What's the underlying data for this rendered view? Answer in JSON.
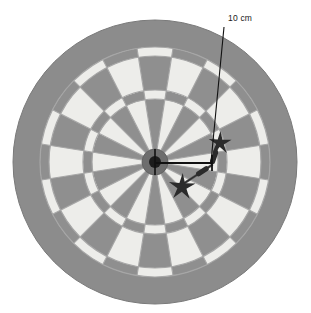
{
  "figure": {
    "background_color": "#ffffff"
  },
  "annotation": {
    "label": "10 cm",
    "label_x": 228,
    "label_y": 21,
    "leader_from": {
      "x": 224,
      "y": 27
    },
    "leader_to": {
      "x": 211,
      "y": 162
    },
    "measure_line": {
      "x1": 155,
      "y1": 163,
      "x2": 212,
      "y2": 163
    },
    "measure_tick": {
      "x": 212,
      "y1": 155,
      "y2": 171
    },
    "line_color": "#111111",
    "text_color": "#1a1a1a"
  },
  "board": {
    "center": {
      "x": 155,
      "y": 162
    },
    "outer_radius": 142,
    "surround_inner_radius": 117,
    "double_outer_radius": 115,
    "double_inner_radius": 106,
    "triple_outer_radius": 72,
    "triple_inner_radius": 63,
    "outer_bull_radius": 13,
    "inner_bull_radius": 6,
    "segment_count": 20,
    "colors": {
      "surround": "#8c8c8c",
      "segment_dark": "#8f8f8f",
      "segment_light": "#ededea",
      "ring_dark": "#8f8f8f",
      "ring_light": "#ededea",
      "wire": "#a6a6a6",
      "outer_bull": "#6e6e6e",
      "inner_bull": "#1c1c1c",
      "board_edge": "#7a7a7a"
    }
  },
  "darts": [
    {
      "name": "upper-dart",
      "tip": {
        "x": 212,
        "y": 163
      },
      "tail": {
        "x": 219,
        "y": 143
      },
      "flight_center": {
        "x": 220,
        "y": 143
      },
      "flight_radius": 12,
      "angle_deg": -70,
      "color": "#2b2b2b",
      "shaft_color": "#555555"
    },
    {
      "name": "lower-dart",
      "tip": {
        "x": 212,
        "y": 165
      },
      "tail": {
        "x": 180,
        "y": 186
      },
      "flight_center": {
        "x": 182,
        "y": 187
      },
      "flight_radius": 14,
      "angle_deg": 147,
      "color": "#2b2b2b",
      "shaft_color": "#555555"
    }
  ],
  "chart_data": {
    "type": "diagram",
    "annotations": [
      {
        "label": "10 cm",
        "measures": "radial distance from bullseye centre to dart impact point"
      }
    ],
    "measured_value": 10,
    "measured_unit": "cm",
    "segment_count": 20,
    "dart_count": 2
  }
}
